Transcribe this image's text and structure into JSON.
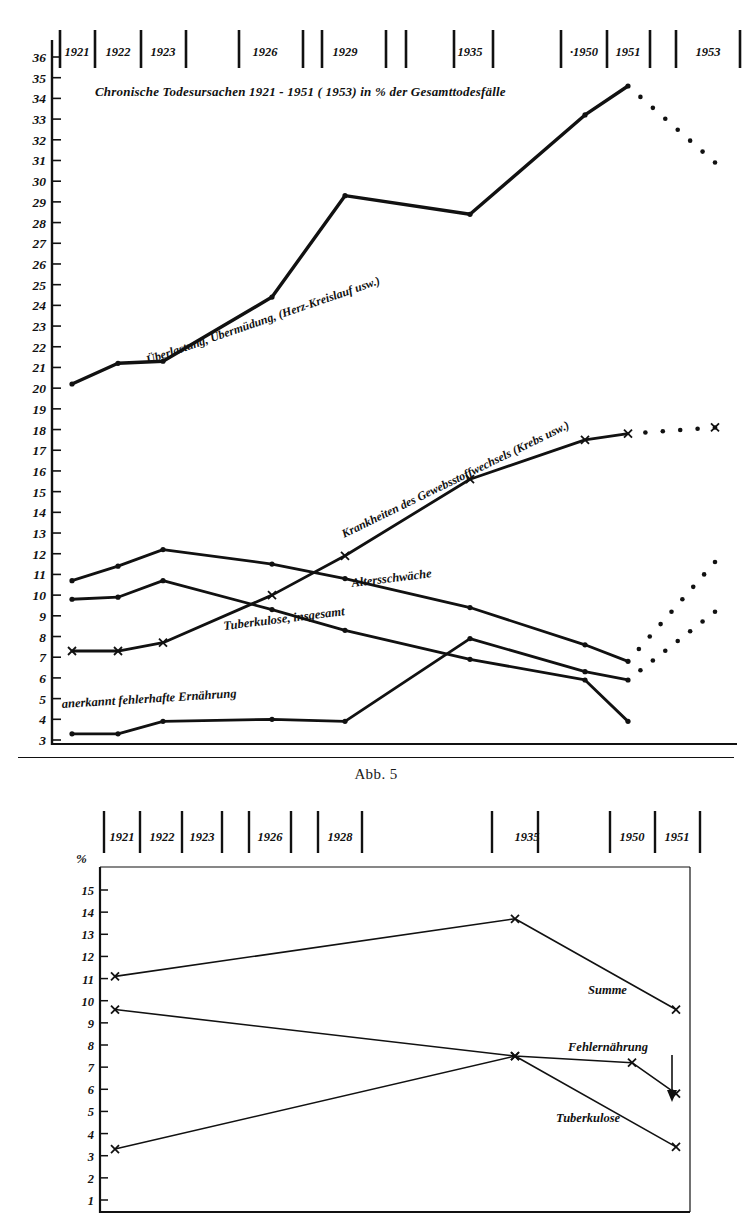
{
  "figure1": {
    "title": "Chronische Todesursachen  1921 - 1951 ( 1953)  in % der Gesamttodesfälle",
    "caption": "Abb. 5",
    "x_tick_labels": [
      "1921",
      "1922",
      "1923",
      "1926",
      "1929",
      "1935",
      "·1950",
      "1951",
      "1953"
    ],
    "y_tick_labels": [
      "36",
      "35",
      "34",
      "33",
      "32",
      "31",
      "30",
      "29",
      "28",
      "27",
      "26",
      "25",
      "24",
      "23",
      "22",
      "21",
      "20",
      "19",
      "18",
      "17",
      "16",
      "15",
      "14",
      "13",
      "12",
      "11",
      "10",
      "9",
      "8",
      "7",
      "6",
      "5",
      "4",
      "3"
    ],
    "series_labels": {
      "ueberlastung": "Überlastung, Übermüdung, (Herz-Kreislauf usw.)",
      "krankheiten": "Krankheiten des Gewebsstoffwechsels (Krebs usw.)",
      "altersschwaeche": "Altersschwäche",
      "tuberkulose": "Tuberkulose, insgesamt",
      "ernaehrung": "anerkannt fehlerhafte Ernährung"
    }
  },
  "figure2": {
    "x_tick_labels": [
      "1921",
      "1922",
      "1923",
      "1926",
      "1928",
      "1935",
      "1950",
      "1951"
    ],
    "y_axis_unit": "%",
    "y_tick_labels": [
      "15",
      "14",
      "13",
      "12",
      "11",
      "10",
      "9",
      "8",
      "7",
      "6",
      "5",
      "4",
      "3",
      "2",
      "1"
    ],
    "series_labels": {
      "summe": "Summe",
      "fehlernaehrung": "Fehlernährung",
      "tuberkulose": "Tuberkulose"
    }
  },
  "chart_data": [
    {
      "type": "line",
      "title": "Chronische Todesursachen 1921 - 1951 (1953) in % der Gesamttodesfälle",
      "xlabel": "",
      "ylabel": "% der Gesamttodesfälle",
      "ylim": [
        3,
        36
      ],
      "grid": false,
      "legend": "inline-labels",
      "x": [
        "1921",
        "1922",
        "1923",
        "1926",
        "1929",
        "1935",
        "1950",
        "1951",
        "1953"
      ],
      "series": [
        {
          "name": "Überlastung, Übermüdung, (Herz-Kreislauf usw.)",
          "marker": "dot",
          "x": [
            "1921",
            "1922",
            "1923",
            "1926",
            "1929",
            "1935",
            "1950",
            "1951"
          ],
          "values": [
            20.2,
            21.2,
            21.3,
            24.4,
            29.3,
            28.4,
            33.2,
            34.6
          ],
          "extension": {
            "style": "dotted",
            "x": [
              "1951",
              "1953"
            ],
            "values": [
              34.6,
              30.9
            ]
          }
        },
        {
          "name": "Krankheiten des Gewebsstoffwechsels (Krebs usw.)",
          "marker": "cross",
          "x": [
            "1921",
            "1922",
            "1923",
            "1926",
            "1929",
            "1935",
            "1950",
            "1951"
          ],
          "values": [
            7.3,
            7.3,
            7.7,
            10.0,
            11.9,
            15.6,
            17.5,
            17.8
          ],
          "extension": {
            "style": "dotted",
            "x": [
              "1951",
              "1953"
            ],
            "values": [
              17.8,
              18.1
            ]
          }
        },
        {
          "name": "Altersschwäche",
          "marker": "dot",
          "x": [
            "1921",
            "1922",
            "1923",
            "1926",
            "1929",
            "1935",
            "1950",
            "1951"
          ],
          "values": [
            10.7,
            11.4,
            12.2,
            11.5,
            10.8,
            9.4,
            7.6,
            6.8
          ],
          "extension": {
            "style": "dotted",
            "x": [
              "1951",
              "1953"
            ],
            "values": [
              6.8,
              11.6
            ]
          }
        },
        {
          "name": "Tuberkulose, insgesamt",
          "marker": "dot",
          "x": [
            "1921",
            "1922",
            "1923",
            "1926",
            "1929",
            "1935",
            "1950",
            "1951"
          ],
          "values": [
            9.8,
            9.9,
            10.7,
            9.3,
            8.3,
            6.9,
            5.9,
            3.9
          ]
        },
        {
          "name": "anerkannt fehlerhafte Ernährung",
          "marker": "dot",
          "x": [
            "1921",
            "1922",
            "1923",
            "1926",
            "1929",
            "1935",
            "1950",
            "1951"
          ],
          "values": [
            3.3,
            3.3,
            3.9,
            4.0,
            3.9,
            7.9,
            6.3,
            5.9
          ],
          "extension": {
            "style": "dotted",
            "x": [
              "1951",
              "1953"
            ],
            "values": [
              5.9,
              9.2
            ]
          }
        }
      ]
    },
    {
      "type": "line",
      "title": "",
      "xlabel": "",
      "ylabel": "%",
      "ylim": [
        1,
        15
      ],
      "grid": false,
      "legend": "right-inline",
      "x": [
        "1921",
        "1922",
        "1923",
        "1926",
        "1928",
        "1935",
        "1950",
        "1951"
      ],
      "series": [
        {
          "name": "Summe",
          "marker": "cross",
          "x": [
            "1921",
            "1935",
            "1951"
          ],
          "values": [
            11.1,
            13.7,
            9.6
          ]
        },
        {
          "name": "Fehlernährung",
          "marker": "cross",
          "x": [
            "1921",
            "1935",
            "1950",
            "1951"
          ],
          "values": [
            9.6,
            7.5,
            7.2,
            5.8
          ]
        },
        {
          "name": "Tuberkulose",
          "marker": "cross",
          "x": [
            "1921",
            "1935",
            "1951"
          ],
          "values": [
            3.3,
            7.5,
            3.4
          ]
        }
      ]
    }
  ]
}
